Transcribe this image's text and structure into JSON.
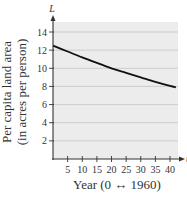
{
  "chart_data": {
    "type": "line",
    "title": "",
    "xlabel": "Year (0 ↔ 1960)",
    "ylabel_lines": [
      "Per capita land area",
      "(in acres per person)"
    ],
    "x_var": "t",
    "y_var": "L",
    "xlim": [
      0,
      43
    ],
    "ylim": [
      0,
      15
    ],
    "xticks": [
      5,
      10,
      15,
      20,
      25,
      30,
      35,
      40
    ],
    "xtick_labels": [
      "5",
      "10",
      "15",
      "20",
      "25",
      "30",
      "35",
      "40"
    ],
    "yticks": [
      2,
      4,
      6,
      8,
      10,
      12,
      14
    ],
    "ytick_labels": [
      "2",
      "4",
      "6",
      "8",
      "10",
      "12",
      "14"
    ],
    "grid": "horizontal",
    "legend": "none",
    "series": [
      {
        "name": "L(t)",
        "x": [
          0,
          5,
          10,
          15,
          20,
          25,
          30,
          35,
          40,
          42
        ],
        "y": [
          12.5,
          11.85,
          11.2,
          10.6,
          10.0,
          9.5,
          9.0,
          8.5,
          8.05,
          7.9
        ]
      }
    ]
  },
  "colors": {
    "plot_bg": "#ececec",
    "grid": "#b8b8b8",
    "axis": "#333333",
    "curve": "#111111"
  }
}
